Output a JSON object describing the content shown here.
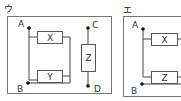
{
  "panels": [
    {
      "label": "ウ",
      "terminals": {
        "a": "A",
        "b": "B",
        "c": "C",
        "d": "D"
      },
      "components": {
        "top": "X",
        "bottom": "Y",
        "side": "Z"
      }
    },
    {
      "label": "エ",
      "terminals": {
        "a": "A",
        "b": "B"
      },
      "components": {
        "top": "X",
        "bottom": "Z"
      }
    }
  ],
  "colors": {
    "line": "#444444",
    "frame": "#777777",
    "dot": "#111111"
  }
}
